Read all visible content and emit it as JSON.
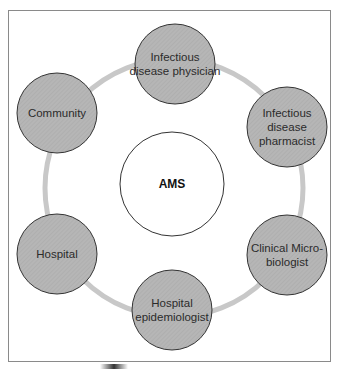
{
  "diagram": {
    "center": {
      "label": "AMS"
    },
    "nodes": [
      {
        "id": "infectious-disease-physician",
        "label": "Infectious\ndisease physician"
      },
      {
        "id": "infectious-disease-pharmacist",
        "label": "Infectious\ndisease\npharmacist"
      },
      {
        "id": "clinical-microbiologist",
        "label": "Clinical Micro-\nbiologist"
      },
      {
        "id": "hospital-epidemiologist",
        "label": "Hospital\nepidemiologist"
      },
      {
        "id": "hospital",
        "label": "Hospital"
      },
      {
        "id": "community",
        "label": "Community"
      }
    ],
    "colors": {
      "node_fill": "#b4b4b4",
      "node_stroke": "#333333",
      "ring": "#c8c8c8",
      "center_fill": "#ffffff",
      "frame": "#8a8a8a"
    }
  }
}
